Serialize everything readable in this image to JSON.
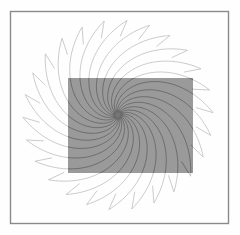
{
  "figure": {
    "canvas": {
      "width": 240,
      "height": 235,
      "background": "#fefefe"
    },
    "frame": {
      "name": "outer-border",
      "x": 10.5,
      "y": 11.5,
      "width": 218,
      "height": 212,
      "stroke": "#8a8a8a",
      "stroke_width": 1.4,
      "fill": "none"
    },
    "overlay_rect": {
      "name": "gray-overlay-rectangle",
      "x": 68,
      "y": 78,
      "width": 125,
      "height": 95,
      "fill": "#9a9a9a",
      "opacity": 1
    },
    "spiral": {
      "name": "logarithmic-spiral-arms",
      "center_x": 118,
      "center_y": 115,
      "arm_count": 26,
      "inner_radius": 3,
      "outer_radius": 95,
      "turn_radians": 2.15,
      "growth": 0.38,
      "hook_length": 17,
      "hook_angle_offset": -0.52,
      "stroke_outside": "#b9b9b9",
      "stroke_inside": "#5d5d5d",
      "stroke_width": 0.75
    },
    "center_blob": {
      "name": "vortex-center",
      "cx": 118,
      "cy": 115,
      "r": 5,
      "fill": "#6a6a6a",
      "opacity": 0.75
    }
  }
}
